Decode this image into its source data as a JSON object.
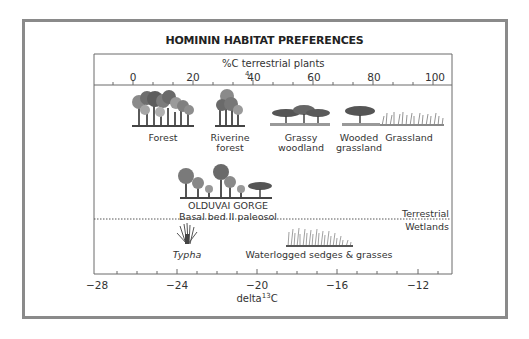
{
  "figure": {
    "title": "HOMININ HABITAT PREFERENCES",
    "top_axis": {
      "label": "%C₄ terrestrial plants",
      "label_prefix": "%C terrestrial plants",
      "subscript_glyph": "4",
      "ticks": [
        "0",
        "20",
        "40",
        "60",
        "80",
        "100"
      ]
    },
    "bottom_axis": {
      "label_base": "delta",
      "label_sup": "13",
      "label_suffix": "C",
      "ticks": [
        "−28",
        "−24",
        "−20",
        "−16",
        "−12"
      ]
    },
    "habitats": [
      {
        "label_line1": "Forest",
        "label_line2": "",
        "icon": "forest-trees-icon"
      },
      {
        "label_line1": "Riverine",
        "label_line2": "forest",
        "icon": "riverine-forest-icon"
      },
      {
        "label_line1": "Grassy",
        "label_line2": "woodland",
        "icon": "acacia-woodland-icon"
      },
      {
        "label_line1": "Wooded",
        "label_line2": "grassland",
        "icon": "acacia-tree-icon"
      },
      {
        "label_line1": "Grassland",
        "label_line2": "",
        "icon": "grass-icon"
      }
    ],
    "site": {
      "name": "OLDUVAI GORGE",
      "subtitle": "Basal bed II paleosol",
      "icon": "mixed-trees-icon"
    },
    "divider": {
      "above": "Terrestrial",
      "below": "Wetlands"
    },
    "wetlands": [
      {
        "label": "Typha",
        "italic": true,
        "icon": "typha-icon"
      },
      {
        "label": "Waterlogged sedges & grasses",
        "italic": false,
        "icon": "sedges-icon"
      }
    ],
    "colors": {
      "frame": "#8a8a8a",
      "axis": "#6a6a6a",
      "tree_dark": "#4a4a4a",
      "tree_mid": "#7d7d7d",
      "tree_light": "#a8a8a8",
      "text": "#2a2a2a"
    }
  }
}
